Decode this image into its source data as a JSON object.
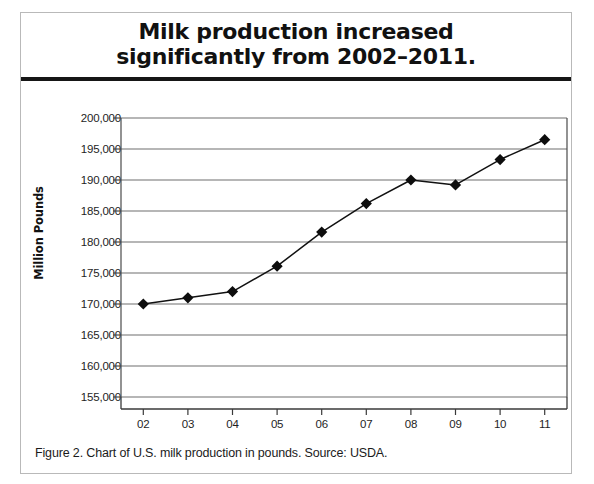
{
  "figure": {
    "title_line1": "Milk production increased",
    "title_line2": "significantly from 2002–2011.",
    "caption": "Figure 2. Chart of U.S. milk production in pounds. Source: USDA."
  },
  "chart_data": {
    "type": "line",
    "title": "Milk production increased significantly from 2002–2011.",
    "xlabel": "",
    "ylabel": "Million Pounds",
    "categories": [
      "02",
      "03",
      "04",
      "05",
      "06",
      "07",
      "08",
      "09",
      "10",
      "11"
    ],
    "values": [
      170000,
      171000,
      172000,
      176100,
      181600,
      186200,
      190000,
      189200,
      193300,
      196500
    ],
    "ylim": [
      155000,
      200000
    ],
    "ytick_values": [
      155000,
      160000,
      165000,
      170000,
      175000,
      180000,
      185000,
      190000,
      195000,
      200000
    ],
    "ytick_labels": [
      "155,000",
      "160,000",
      "165,000",
      "170,000",
      "175,000",
      "180,000",
      "185,000",
      "190,000",
      "195,000",
      "200,000"
    ],
    "grid": true,
    "legend": null,
    "marker": "diamond",
    "line_color": "#111111",
    "marker_color": "#0d0d0d",
    "grid_color": "#6f6f6f"
  }
}
